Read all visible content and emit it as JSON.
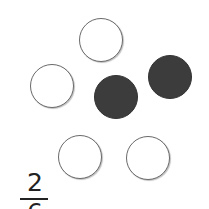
{
  "diagram": {
    "circles": [
      {
        "cx": 101,
        "cy": 40,
        "r": 22,
        "shaded": false
      },
      {
        "cx": 52,
        "cy": 86,
        "r": 22,
        "shaded": false
      },
      {
        "cx": 116,
        "cy": 97,
        "r": 22,
        "shaded": true
      },
      {
        "cx": 170,
        "cy": 77,
        "r": 22,
        "shaded": true
      },
      {
        "cx": 80,
        "cy": 157,
        "r": 22,
        "shaded": false
      },
      {
        "cx": 148,
        "cy": 158,
        "r": 22,
        "shaded": false
      }
    ],
    "colors": {
      "shaded": "#3c3c3c",
      "outline": "#6a6a6a"
    },
    "fraction": {
      "numerator": "2",
      "denominator": "6"
    }
  }
}
